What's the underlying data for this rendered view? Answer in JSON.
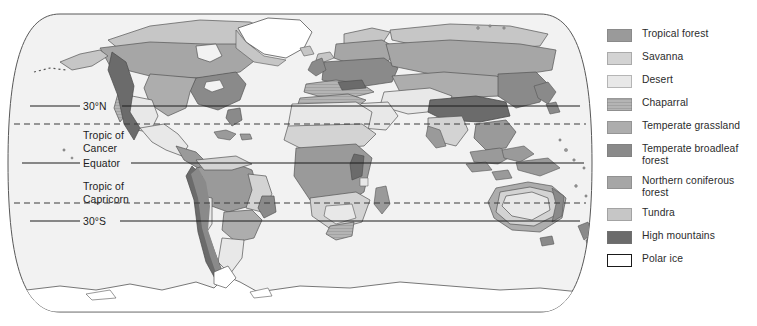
{
  "map": {
    "title": "World biomes map",
    "projection": "oval",
    "ocean_color": "#f2f2f2",
    "outline_color": "#585858",
    "latitude_lines": [
      {
        "id": "lat-30n",
        "label": "30°N",
        "style": "solid",
        "y": 106
      },
      {
        "id": "tropic-cancer",
        "label_line1": "Tropic of",
        "label_line2": "Cancer",
        "style": "dashed",
        "y": 124
      },
      {
        "id": "equator",
        "label": "Equator",
        "style": "solid",
        "y": 163
      },
      {
        "id": "tropic-capricorn",
        "label_line1": "Tropic of",
        "label_line2": "Capricorn",
        "style": "dashed",
        "y": 203
      },
      {
        "id": "lat-30s",
        "label": "30°S",
        "style": "solid",
        "y": 221
      }
    ]
  },
  "legend": {
    "items": [
      {
        "id": "tropical-forest",
        "label": "Tropical forest",
        "color": "#9a9a9a",
        "outlined": false
      },
      {
        "id": "savanna",
        "label": "Savanna",
        "color": "#d3d3d3",
        "outlined": false
      },
      {
        "id": "desert",
        "label": "Desert",
        "color": "#e8e8e8",
        "outlined": false
      },
      {
        "id": "chaparral",
        "label": "Chaparral",
        "color": "#b4b4b4",
        "outlined": false
      },
      {
        "id": "temperate-grassland",
        "label": "Temperate grassland",
        "color": "#adadad",
        "outlined": false
      },
      {
        "id": "temperate-broadleaf-forest",
        "label": "Temperate broadleaf forest",
        "color": "#8a8a8a",
        "outlined": false
      },
      {
        "id": "northern-coniferous-forest",
        "label": "Northern coniferous forest",
        "color": "#a6a6a6",
        "outlined": false
      },
      {
        "id": "tundra",
        "label": "Tundra",
        "color": "#c6c6c6",
        "outlined": false
      },
      {
        "id": "high-mountains",
        "label": "High mountains",
        "color": "#6b6b6b",
        "outlined": false
      },
      {
        "id": "polar-ice",
        "label": "Polar ice",
        "color": "#ffffff",
        "outlined": true
      }
    ]
  }
}
